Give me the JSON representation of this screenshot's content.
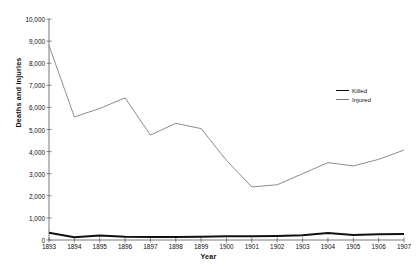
{
  "chart_data": {
    "type": "line",
    "title": "",
    "xlabel": "Year",
    "ylabel": "Deaths and injuries",
    "categories": [
      "1893",
      "1894",
      "1895",
      "1896",
      "1897",
      "1898",
      "1899",
      "1900",
      "1901",
      "1902",
      "1903",
      "1904",
      "1905",
      "1906",
      "1907"
    ],
    "x": [
      1893,
      1894,
      1895,
      1896,
      1897,
      1898,
      1899,
      1900,
      1901,
      1902,
      1903,
      1904,
      1905,
      1906,
      1907
    ],
    "series": [
      {
        "name": "Killed",
        "values": [
          330,
          130,
          200,
          150,
          140,
          140,
          150,
          170,
          170,
          180,
          210,
          320,
          230,
          260,
          270
        ]
      },
      {
        "name": "Injured",
        "values": [
          8800,
          5570,
          5950,
          6430,
          4750,
          5280,
          5040,
          3600,
          2400,
          2500,
          3000,
          3500,
          3350,
          3650,
          4070
        ]
      }
    ],
    "ylim": [
      0,
      10000
    ],
    "ytick_values": [
      0,
      1000,
      2000,
      3000,
      4000,
      5000,
      6000,
      7000,
      8000,
      9000,
      10000
    ],
    "ytick_labels": [
      "0",
      "1,000",
      "2,000",
      "3,000",
      "4,000",
      "5,000",
      "6,000",
      "7,000",
      "8,000",
      "9,000",
      "10,000"
    ],
    "grid": false,
    "legend_position": "right",
    "legend": [
      "Killed",
      "Injured"
    ],
    "colors": {
      "killed": "#111111",
      "injured": "#808080",
      "axis": "#555555",
      "background": "#ffffff"
    }
  }
}
